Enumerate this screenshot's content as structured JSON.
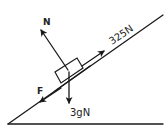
{
  "diagram": {
    "type": "free-body-diagram",
    "forces": {
      "normal": {
        "label": "N"
      },
      "pull": {
        "label": "325N"
      },
      "friction": {
        "label": "F"
      },
      "weight": {
        "label": "3gN"
      }
    },
    "colors": {
      "stroke": "#1a1a1a",
      "background": "#ffffff",
      "text": "#222222"
    }
  }
}
